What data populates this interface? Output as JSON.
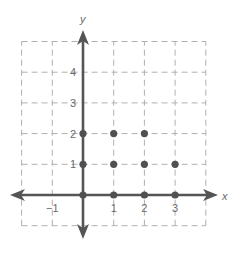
{
  "chart_data": {
    "type": "scatter",
    "title": "",
    "xlabel": "x",
    "ylabel": "y",
    "xlim": [
      -2,
      4
    ],
    "ylim": [
      -1,
      5
    ],
    "grid": true,
    "grid_style": "dashed",
    "x_ticks": [
      -1,
      1,
      2,
      3
    ],
    "x_tick_labels": [
      "−1",
      "1",
      "2",
      "3"
    ],
    "y_ticks": [
      1,
      2,
      3,
      4
    ],
    "y_tick_labels": [
      "1",
      "2",
      "3",
      "4"
    ],
    "series": [
      {
        "name": "points",
        "points": [
          {
            "x": 0,
            "y": 0
          },
          {
            "x": 1,
            "y": 0
          },
          {
            "x": 2,
            "y": 0
          },
          {
            "x": 3,
            "y": 0
          },
          {
            "x": 0,
            "y": 1
          },
          {
            "x": 1,
            "y": 1
          },
          {
            "x": 2,
            "y": 1
          },
          {
            "x": 3,
            "y": 1
          },
          {
            "x": 0,
            "y": 2
          },
          {
            "x": 1,
            "y": 2
          },
          {
            "x": 2,
            "y": 2
          }
        ]
      }
    ],
    "legend": null
  },
  "colors": {
    "axis": "#555555",
    "grid": "#b0b0b0",
    "point": "#505050",
    "label": "#6a6a6a"
  }
}
